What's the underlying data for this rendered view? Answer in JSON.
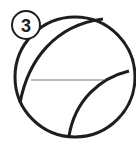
{
  "diagram": {
    "step_badge": {
      "number": "3"
    },
    "shape": "ball-with-seams",
    "colors": {
      "stroke": "#1e1e1e",
      "guide_line": "#a0a0a0",
      "background": "#ffffff"
    }
  }
}
